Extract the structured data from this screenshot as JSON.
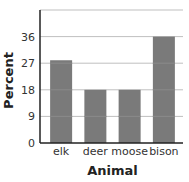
{
  "chart_data": {
    "type": "bar",
    "title": "",
    "xlabel": "Animal",
    "ylabel": "Percent",
    "categories": [
      "elk",
      "deer",
      "moose",
      "bison"
    ],
    "values": [
      28,
      18,
      18,
      36
    ],
    "yticks": [
      0,
      9,
      18,
      27,
      36
    ],
    "ylim": [
      0,
      45
    ],
    "grid": true,
    "legend": null,
    "colors": {
      "bar": "#7a7a7a",
      "grid": "#bfbfbf",
      "axis": "#222222"
    }
  }
}
